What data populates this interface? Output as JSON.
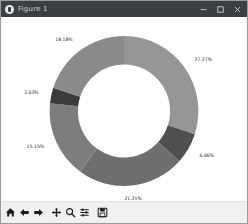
{
  "window": {
    "title": "Figure 1",
    "app_icon": "matplotlib-icon",
    "controls": {
      "minimize": "Minimize",
      "maximize": "Maximize",
      "close": "Close"
    }
  },
  "toolbar": {
    "buttons": [
      {
        "name": "home-button",
        "label": "Home",
        "icon": "home-icon"
      },
      {
        "name": "back-button",
        "label": "Back",
        "icon": "arrow-left-icon"
      },
      {
        "name": "forward-button",
        "label": "Forward",
        "icon": "arrow-right-icon"
      },
      {
        "name": "pan-button",
        "label": "Pan",
        "icon": "move-icon"
      },
      {
        "name": "zoom-button",
        "label": "Zoom",
        "icon": "magnifier-icon"
      },
      {
        "name": "configure-subplots-button",
        "label": "Configure subplots",
        "icon": "sliders-icon"
      },
      {
        "name": "save-button",
        "label": "Save",
        "icon": "floppy-disk-icon"
      }
    ]
  },
  "chart_data": {
    "type": "pie",
    "variant": "donut",
    "title": "",
    "xlabel": "",
    "ylabel": "",
    "legend": false,
    "grid": false,
    "startangle": 90,
    "counterclock": false,
    "donut_hole_ratio": 0.62,
    "labels": [
      "27.27%",
      "6.06%",
      "21.21%",
      "15.15%",
      "3.03%",
      "18.18%"
    ],
    "values": [
      27.27,
      6.06,
      21.21,
      15.15,
      3.03,
      18.18
    ],
    "counts": [
      9,
      2,
      7,
      5,
      1,
      6
    ],
    "total_count": 33,
    "colors": [
      "#969696",
      "#4f4f4f",
      "#6e6e6e",
      "#7d7d7d",
      "#3a3a3a",
      "#8a8a8a"
    ],
    "label_color": "#1a1a1a",
    "background": "#ffffff"
  }
}
